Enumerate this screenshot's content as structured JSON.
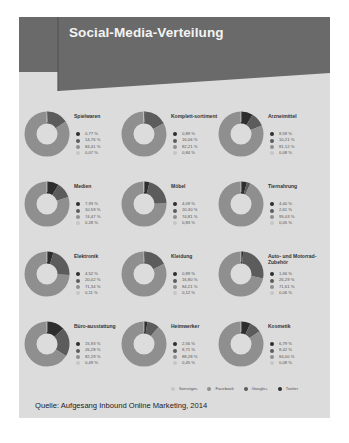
{
  "header": {
    "title": "Social-Media-Verteilung"
  },
  "colors": {
    "sonstiges": "#c6c6c6",
    "facebook": "#8f8f8f",
    "googleplus": "#5c5c5c",
    "twitter": "#2e2e2e",
    "banner": "#6a6a6a",
    "panel": "#dcdcdc"
  },
  "legend": {
    "items": [
      {
        "label": "Sonstiges",
        "color": "#c6c6c6"
      },
      {
        "label": "Facebook",
        "color": "#8f8f8f"
      },
      {
        "label": "Google+",
        "color": "#5c5c5c"
      },
      {
        "label": "Twitter",
        "color": "#2e2e2e"
      }
    ]
  },
  "source": "Quelle: Aufgesang Inbound Online Marketing, 2014",
  "chart_data": {
    "type": "pie",
    "title": "Social-Media-Verteilung",
    "series_order": [
      "Twitter",
      "Google+",
      "Facebook",
      "Sonstiges"
    ],
    "categories": [
      {
        "name": "Spielwaren",
        "values": [
          0.77,
          14.76,
          84.41,
          0.07
        ],
        "labels": [
          "0,77 %",
          "14,76 %",
          "84,41 %",
          "0,07 %"
        ]
      },
      {
        "name": "Komplett-sortiment",
        "values": [
          0.89,
          16.06,
          82.21,
          0.84
        ],
        "labels": [
          "0,89 %",
          "16,06 %",
          "82,21 %",
          "0,84 %"
        ]
      },
      {
        "name": "Arzneimittel",
        "values": [
          8.59,
          10.21,
          81.12,
          0.08
        ],
        "labels": [
          "8,59 %",
          "10,21 %",
          "81,12 %",
          "0,08 %"
        ]
      },
      {
        "name": "Medien",
        "values": [
          7.93,
          10.59,
          74.47,
          0.28
        ],
        "labels": [
          "7,93 %",
          "10,59 %",
          "74,47 %",
          "0,28 %"
        ]
      },
      {
        "name": "Möbel",
        "values": [
          4.09,
          20.3,
          74.81,
          0.83
        ],
        "labels": [
          "4,09 %",
          "20,30 %",
          "74,81 %",
          "0,83 %"
        ]
      },
      {
        "name": "Tiernahrung",
        "values": [
          4.4,
          2.61,
          95.03,
          0.05
        ],
        "labels": [
          "4,40 %",
          "2,61 %",
          "95,03 %",
          "0,05 %"
        ]
      },
      {
        "name": "Elektronik",
        "values": [
          4.52,
          20.02,
          71.34,
          0.11
        ],
        "labels": [
          "4,52 %",
          "20,02 %",
          "71,34 %",
          "0,11 %"
        ]
      },
      {
        "name": "Kleidung",
        "values": [
          0.89,
          16.8,
          84.21,
          0.12
        ],
        "labels": [
          "0,89 %",
          "16,80 %",
          "84,21 %",
          "0,12 %"
        ]
      },
      {
        "name": "Auto- und Motorrad-Zubehör",
        "values": [
          1.66,
          26.29,
          71.61,
          0.06
        ],
        "labels": [
          "1,66 %",
          "26,29 %",
          "71,61 %",
          "0,06 %"
        ]
      },
      {
        "name": "Büro-ausstattung",
        "values": [
          15.93,
          26.28,
          82.29,
          0.49
        ],
        "labels": [
          "15,93 %",
          "26,28 %",
          "82,29 %",
          "0,49 %"
        ]
      },
      {
        "name": "Heimwerker",
        "values": [
          2.56,
          8.71,
          88.28,
          0.45
        ],
        "labels": [
          "2,56 %",
          "8,71 %",
          "88,28 %",
          "0,45 %"
        ]
      },
      {
        "name": "Kosmetik",
        "values": [
          6.79,
          8.42,
          84.0,
          0.08
        ],
        "labels": [
          "6,79 %",
          "8,42 %",
          "84,00 %",
          "0,08 %"
        ]
      }
    ],
    "legend_position": "bottom-right",
    "source": "Quelle: Aufgesang Inbound Online Marketing, 2014"
  }
}
